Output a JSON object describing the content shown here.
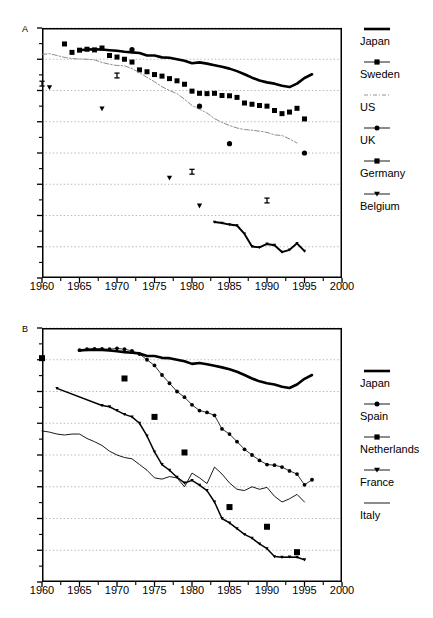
{
  "figure": {
    "panels": [
      {
        "letter": "A",
        "xlabel": "",
        "ylabel": "",
        "xticks": [
          "1960",
          "1965",
          "1970",
          "1975",
          "1980",
          "1985",
          "1990",
          "1995",
          "2000"
        ],
        "yticks": [
          "0.1",
          "0.2",
          "0.3",
          "0.4",
          "0.5",
          "0.6",
          "0.7",
          "0.8",
          "0.9"
        ],
        "legend": [
          {
            "label": "Japan",
            "key": "thick-solid-line"
          },
          {
            "label": "Sweden",
            "key": "square-marker-line"
          },
          {
            "label": "US",
            "key": "thin-dashed-line"
          },
          {
            "label": "UK",
            "key": "circle-marker-line"
          },
          {
            "label": "Germany",
            "key": "square-marker-line"
          },
          {
            "label": "Belgium",
            "key": "triangle-marker-line"
          }
        ]
      },
      {
        "letter": "B",
        "xlabel": "",
        "ylabel": "",
        "xticks": [
          "1960",
          "1965",
          "1970",
          "1975",
          "1980",
          "1985",
          "1990",
          "1995",
          "2000"
        ],
        "yticks": [
          "0.1",
          "0.2",
          "0.3",
          "0.4",
          "0.5",
          "0.6",
          "0.7",
          "0.8",
          "0.9"
        ],
        "legend": [
          {
            "label": "Japan",
            "key": "thick-solid-line"
          },
          {
            "label": "Spain",
            "key": "circle-marker-line"
          },
          {
            "label": "Netherlands",
            "key": "square-marker-line"
          },
          {
            "label": "France",
            "key": "triangle-marker-line"
          },
          {
            "label": "Italy",
            "key": "thin-plain-line"
          }
        ]
      }
    ]
  },
  "chart_data": [
    {
      "type": "line",
      "title": "",
      "panel": "A",
      "xlabel": "",
      "ylabel": "",
      "xlim": [
        1960,
        2000
      ],
      "ylim": [
        0.1,
        0.9
      ],
      "xticks": [
        1960,
        1965,
        1970,
        1975,
        1980,
        1985,
        1990,
        1995,
        2000
      ],
      "yticks": [
        0.1,
        0.2,
        0.3,
        0.4,
        0.5,
        0.6,
        0.7,
        0.8,
        0.9
      ],
      "grid": "horizontal-dotted",
      "legend_position": "right",
      "series": [
        {
          "name": "Japan",
          "style": "thick-solid-line",
          "x": [
            1965,
            1966,
            1967,
            1968,
            1969,
            1970,
            1971,
            1972,
            1973,
            1974,
            1975,
            1976,
            1977,
            1978,
            1979,
            1980,
            1981,
            1982,
            1983,
            1984,
            1985,
            1986,
            1987,
            1988,
            1989,
            1990,
            1991,
            1992,
            1993,
            1994,
            1995,
            1996
          ],
          "y": [
            0.829,
            0.831,
            0.832,
            0.831,
            0.829,
            0.827,
            0.824,
            0.822,
            0.82,
            0.812,
            0.812,
            0.806,
            0.805,
            0.8,
            0.795,
            0.787,
            0.79,
            0.786,
            0.781,
            0.776,
            0.77,
            0.762,
            0.752,
            0.741,
            0.732,
            0.726,
            0.722,
            0.715,
            0.711,
            0.722,
            0.74,
            0.752,
            0.753,
            0.749
          ]
        },
        {
          "name": "Sweden",
          "style": "square-marker-line",
          "x": [
            1963,
            1964,
            1965,
            1966,
            1967,
            1968,
            1969,
            1970,
            1971,
            1972,
            1973,
            1974,
            1975,
            1976,
            1977,
            1978,
            1979,
            1980,
            1981,
            1982,
            1983,
            1984,
            1985,
            1986,
            1987,
            1988,
            1989,
            1990,
            1991,
            1992,
            1993,
            1994,
            1995
          ],
          "y": [
            0.849,
            0.822,
            0.829,
            0.832,
            0.83,
            0.836,
            0.812,
            0.807,
            0.8,
            0.791,
            0.766,
            0.76,
            0.751,
            0.746,
            0.738,
            0.731,
            0.72,
            0.698,
            0.691,
            0.69,
            0.691,
            0.684,
            0.683,
            0.678,
            0.66,
            0.656,
            0.652,
            0.65,
            0.636,
            0.626,
            0.631,
            0.643,
            0.609,
            0.582,
            0.566,
            0.567
          ]
        },
        {
          "name": "US",
          "style": "thin-dashed-line",
          "x": [
            1960,
            1961,
            1962,
            1963,
            1964,
            1965,
            1966,
            1967,
            1968,
            1969,
            1970,
            1971,
            1972,
            1973,
            1974,
            1975,
            1976,
            1977,
            1978,
            1979,
            1980,
            1981,
            1982,
            1983,
            1984,
            1985,
            1986,
            1987,
            1988,
            1989,
            1990,
            1991,
            1992,
            1993,
            1994
          ],
          "y": [
            0.815,
            0.818,
            0.812,
            0.806,
            0.802,
            0.801,
            0.8,
            0.798,
            0.79,
            0.784,
            0.78,
            0.779,
            0.77,
            0.757,
            0.742,
            0.728,
            0.712,
            0.7,
            0.69,
            0.672,
            0.652,
            0.64,
            0.628,
            0.61,
            0.598,
            0.588,
            0.58,
            0.575,
            0.573,
            0.57,
            0.566,
            0.558,
            0.556,
            0.545,
            0.532
          ]
        },
        {
          "name": "UK",
          "style": "circle-marker-line",
          "x": [
            1972,
            1981,
            1985,
            1995
          ],
          "y": [
            0.831,
            0.65,
            0.53,
            0.5
          ]
        },
        {
          "name": "Germany",
          "style": "square-marker-line",
          "x": [
            1960,
            1970,
            1980,
            1990
          ],
          "y": [
            0.722,
            0.748,
            0.44,
            0.348
          ]
        },
        {
          "name": "Belgium",
          "style": "triangle-marker-line",
          "x": [
            1961,
            1968,
            1977,
            1981
          ],
          "y": [
            0.71,
            0.642,
            0.42,
            0.331
          ]
        },
        {
          "name": "Belgium-series",
          "style": "triangle-marker-line",
          "x": [
            1983,
            1984,
            1985,
            1986,
            1987,
            1988,
            1989,
            1990,
            1991,
            1992,
            1993,
            1994,
            1995
          ],
          "y": [
            0.279,
            0.276,
            0.271,
            0.268,
            0.241,
            0.201,
            0.198,
            0.209,
            0.205,
            0.183,
            0.19,
            0.211,
            0.186,
            0.182,
            0.19
          ]
        }
      ]
    },
    {
      "type": "line",
      "title": "",
      "panel": "B",
      "xlabel": "",
      "ylabel": "",
      "xlim": [
        1960,
        2000
      ],
      "ylim": [
        0.1,
        0.9
      ],
      "xticks": [
        1960,
        1965,
        1970,
        1975,
        1980,
        1985,
        1990,
        1995,
        2000
      ],
      "yticks": [
        0.1,
        0.2,
        0.3,
        0.4,
        0.5,
        0.6,
        0.7,
        0.8,
        0.9
      ],
      "grid": "horizontal-dotted",
      "legend_position": "right",
      "series": [
        {
          "name": "Japan",
          "style": "thick-solid-line",
          "x": [
            1965,
            1966,
            1967,
            1968,
            1969,
            1970,
            1971,
            1972,
            1973,
            1974,
            1975,
            1976,
            1977,
            1978,
            1979,
            1980,
            1981,
            1982,
            1983,
            1984,
            1985,
            1986,
            1987,
            1988,
            1989,
            1990,
            1991,
            1992,
            1993,
            1994,
            1995,
            1996
          ],
          "y": [
            0.829,
            0.831,
            0.832,
            0.831,
            0.829,
            0.827,
            0.824,
            0.822,
            0.82,
            0.812,
            0.812,
            0.806,
            0.805,
            0.8,
            0.795,
            0.787,
            0.79,
            0.786,
            0.781,
            0.776,
            0.77,
            0.762,
            0.752,
            0.741,
            0.732,
            0.726,
            0.722,
            0.715,
            0.711,
            0.722,
            0.74,
            0.752,
            0.753,
            0.749
          ]
        },
        {
          "name": "Spain",
          "style": "circle-marker-line",
          "x": [
            1965,
            1966,
            1967,
            1968,
            1969,
            1970,
            1971,
            1972,
            1973,
            1974,
            1975,
            1976,
            1977,
            1978,
            1979,
            1980,
            1981,
            1982,
            1983,
            1984,
            1985,
            1986,
            1987,
            1988,
            1989,
            1990,
            1991,
            1992,
            1993,
            1994,
            1995,
            1996
          ],
          "y": [
            0.83,
            0.833,
            0.834,
            0.834,
            0.833,
            0.836,
            0.833,
            0.828,
            0.818,
            0.8,
            0.782,
            0.752,
            0.726,
            0.7,
            0.682,
            0.658,
            0.64,
            0.634,
            0.625,
            0.582,
            0.566,
            0.542,
            0.518,
            0.5,
            0.483,
            0.47,
            0.468,
            0.462,
            0.45,
            0.44,
            0.406,
            0.422
          ]
        },
        {
          "name": "Netherlands",
          "style": "square-marker-line",
          "x": [
            1960,
            1971,
            1975,
            1979,
            1985,
            1990,
            1994
          ],
          "y": [
            0.805,
            0.741,
            0.62,
            0.508,
            0.336,
            0.274,
            0.194
          ]
        },
        {
          "name": "France",
          "style": "triangle-marker-line",
          "x": [
            1962,
            1968,
            1969,
            1970,
            1971,
            1972,
            1973,
            1974,
            1975,
            1976,
            1977,
            1978,
            1979,
            1980,
            1981,
            1982,
            1983,
            1984,
            1985,
            1986,
            1987,
            1988,
            1989,
            1990,
            1991,
            1992,
            1993,
            1994,
            1995
          ],
          "y": [
            0.71,
            0.656,
            0.652,
            0.64,
            0.628,
            0.62,
            0.6,
            0.56,
            0.51,
            0.47,
            0.452,
            0.43,
            0.412,
            0.42,
            0.405,
            0.388,
            0.352,
            0.3,
            0.286,
            0.268,
            0.25,
            0.238,
            0.22,
            0.205,
            0.18,
            0.178,
            0.179,
            0.178,
            0.17,
            0.165
          ]
        },
        {
          "name": "Italy",
          "style": "thin-plain-line",
          "x": [
            1960,
            1961,
            1962,
            1963,
            1964,
            1965,
            1966,
            1967,
            1968,
            1969,
            1970,
            1971,
            1972,
            1973,
            1974,
            1975,
            1976,
            1977,
            1978,
            1979,
            1980,
            1981,
            1982,
            1983,
            1984,
            1985,
            1986,
            1987,
            1988,
            1989,
            1990,
            1991,
            1992,
            1993,
            1994,
            1995
          ],
          "y": [
            0.576,
            0.572,
            0.566,
            0.563,
            0.566,
            0.566,
            0.552,
            0.542,
            0.53,
            0.512,
            0.5,
            0.492,
            0.488,
            0.47,
            0.452,
            0.428,
            0.424,
            0.432,
            0.428,
            0.4,
            0.443,
            0.428,
            0.41,
            0.462,
            0.44,
            0.412,
            0.392,
            0.388,
            0.4,
            0.392,
            0.398,
            0.37,
            0.352,
            0.362,
            0.376,
            0.352,
            0.338,
            0.312
          ]
        }
      ]
    }
  ]
}
